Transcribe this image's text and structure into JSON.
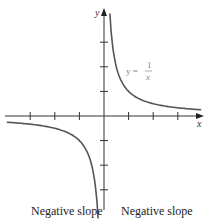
{
  "chart_data": {
    "type": "line",
    "title": "",
    "xlabel": "x",
    "ylabel": "y",
    "series": [
      {
        "name": "y = 1/x",
        "function": "1/x",
        "color": "#555555"
      }
    ],
    "xlim": [
      -4,
      4
    ],
    "ylim": [
      -4,
      4
    ],
    "x_ticks": [
      -3,
      -2,
      -1,
      1,
      2,
      3
    ],
    "y_ticks": [
      -3,
      -2,
      -1,
      1,
      2,
      3
    ],
    "tick_labels_shown": false,
    "grid": false,
    "annotations": [
      {
        "text": "y = 1/x",
        "position": "first quadrant"
      }
    ],
    "captions": [
      "Negative slope",
      "Negative slope"
    ]
  },
  "equation": {
    "lhs": "y =",
    "num": "1",
    "den": "x"
  },
  "captions": {
    "left": "Negative slope",
    "right": "Negative slope"
  }
}
